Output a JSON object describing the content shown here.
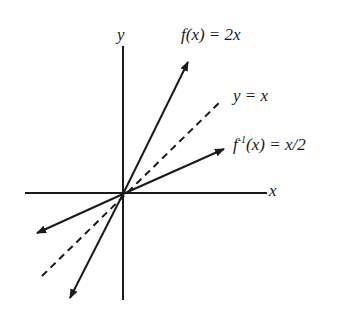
{
  "labels": {
    "y_axis": "y",
    "x_axis": "x",
    "f": "f(x)  =  2x",
    "identity": "y  =  x",
    "inverse_prefix": "f",
    "inverse_sup": "-1",
    "inverse_rest": "(x)  =  x/2"
  },
  "colors": {
    "ink": "#1a1a1a",
    "background": "#ffffff"
  },
  "lines": [
    {
      "name": "f(x) = 2x",
      "style": "solid",
      "arrows": "both"
    },
    {
      "name": "y = x",
      "style": "dashed",
      "arrows": "none"
    },
    {
      "name": "f^-1(x) = x/2",
      "style": "solid",
      "arrows": "both"
    }
  ]
}
